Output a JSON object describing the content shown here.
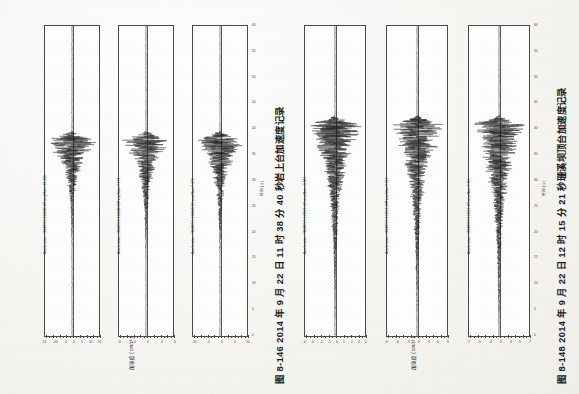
{
  "page": {
    "orientation": "rotated-90-ccw",
    "background_color": "#f7f6f2",
    "ink_color": "#2b2b2b"
  },
  "figures": [
    {
      "id": "figure-8-146",
      "caption": "图 8-146    2014 年 9 月 22 日 11 时 38 分 40 秒岩上台加速度记录",
      "time_axis_label": "时间 ( s )",
      "acc_axis_label": "加速度 ( cm/s² )",
      "time_ticks": [
        "0",
        "5",
        "10",
        "15",
        "20",
        "25",
        "30",
        "35",
        "40",
        "45",
        "50",
        "55",
        "60"
      ],
      "panels": [
        {
          "title": "Acceleration: 20140922-113840-UD  ampMax=-13.365",
          "component": "UD",
          "amp_ticks": [
            "-15",
            "-10",
            "-5",
            "0",
            "5",
            "10",
            "15"
          ],
          "peak": 13.365
        },
        {
          "title": "Acceleration: 20140922-113840-EW  ampMax=7.197",
          "component": "EW",
          "amp_ticks": [
            "-8",
            "-4",
            "0",
            "4",
            "8"
          ],
          "peak": 7.197
        },
        {
          "title": "Acceleration: 20140922-113840-NS  ampMax=9.598",
          "component": "NS",
          "amp_ticks": [
            "-10",
            "-5",
            "0",
            "5",
            "10"
          ],
          "peak": 9.598
        }
      ]
    },
    {
      "id": "figure-8-148",
      "caption": "图 8-148    2014 年 9 月 22 日 12 时 15 分 21 秒珊溪坝顶台加速度记录",
      "time_axis_label": "时间 ( s )",
      "acc_axis_label": "加速度 ( cm/s² )",
      "time_ticks": [
        "0",
        "5",
        "10",
        "15",
        "20",
        "25",
        "30",
        "35",
        "40",
        "45",
        "50",
        "55",
        "60"
      ],
      "panels": [
        {
          "title": "Acceleration: 20140922-121521-UD  ampMax=-3.647",
          "component": "UD",
          "amp_ticks": [
            "-4",
            "-3",
            "-2",
            "-1",
            "0",
            "1",
            "2",
            "3",
            "4"
          ],
          "peak": 3.647
        },
        {
          "title": "Acceleration: 20140922-121521-EW  ampMax=9.517",
          "component": "EW",
          "amp_ticks": [
            "-9",
            "-6",
            "-3",
            "0",
            "3",
            "6",
            "9"
          ],
          "peak": 9.517
        },
        {
          "title": "Acceleration: 20140922-121521-NS  ampMax=7.111",
          "component": "NS",
          "amp_ticks": [
            "-7",
            "-5",
            "-3",
            "0",
            "3",
            "5",
            "7"
          ],
          "peak": 7.111
        }
      ]
    }
  ],
  "chart_data": {
    "type": "line",
    "xlabel": "时间 ( s )",
    "ylabel": "加速度 ( cm/s² )",
    "xlim": [
      0,
      60
    ],
    "grid": false,
    "legend": "none",
    "series": [
      {
        "name": "20140922-113840-UD",
        "figure": "8-146",
        "peak_amplitude": -13.365,
        "ylim": [
          -15,
          15
        ],
        "onset_s": 21,
        "coda_end_s": 33
      },
      {
        "name": "20140922-113840-EW",
        "figure": "8-146",
        "peak_amplitude": 7.197,
        "ylim": [
          -8,
          8
        ],
        "onset_s": 21,
        "coda_end_s": 34
      },
      {
        "name": "20140922-113840-NS",
        "figure": "8-146",
        "peak_amplitude": 9.598,
        "ylim": [
          -10,
          10
        ],
        "onset_s": 21,
        "coda_end_s": 34
      },
      {
        "name": "20140922-121521-UD",
        "figure": "8-148",
        "peak_amplitude": -3.647,
        "ylim": [
          -4,
          4
        ],
        "onset_s": 18,
        "coda_end_s": 40
      },
      {
        "name": "20140922-121521-EW",
        "figure": "8-148",
        "peak_amplitude": 9.517,
        "ylim": [
          -9,
          9
        ],
        "onset_s": 18,
        "coda_end_s": 40
      },
      {
        "name": "20140922-121521-NS",
        "figure": "8-148",
        "peak_amplitude": 7.111,
        "ylim": [
          -7,
          7
        ],
        "onset_s": 18,
        "coda_end_s": 42
      }
    ]
  }
}
